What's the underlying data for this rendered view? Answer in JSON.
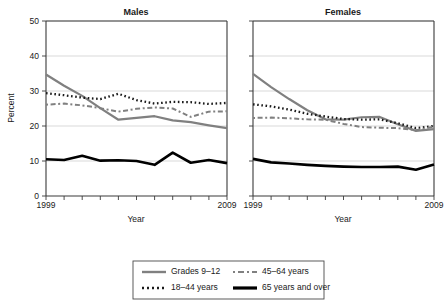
{
  "chart_data": {
    "type": "line",
    "title": "",
    "xlabel": "Year",
    "ylabel": "Percent",
    "ylim": [
      0,
      50
    ],
    "yticks": [
      0,
      10,
      20,
      30,
      40,
      50
    ],
    "ytick_labels": [
      "0",
      "10",
      "20",
      "30",
      "40",
      "50"
    ],
    "xlim": [
      1999,
      2009
    ],
    "x": [
      1999,
      2000,
      2001,
      2002,
      2003,
      2004,
      2005,
      2006,
      2007,
      2008,
      2009
    ],
    "xtick_labels_shown": [
      "1999",
      "2009"
    ],
    "grid": "horizontal",
    "legend_position": "bottom-center",
    "panels": [
      {
        "name": "males",
        "title": "Males",
        "xlabel": "Year",
        "series": [
          {
            "name": "Grades 9-12",
            "style": "solid-gray",
            "color": "#808080",
            "values": [
              34.7,
              31.5,
              28.6,
              25.1,
              21.8,
              22.3,
              22.8,
              21.6,
              21.1,
              20.2,
              19.4
            ]
          },
          {
            "name": "18-44 years",
            "style": "dotted-black",
            "color": "#1a1a1a",
            "values": [
              29.4,
              28.8,
              28.1,
              27.7,
              29.2,
              27.4,
              26.4,
              26.9,
              26.8,
              26.3,
              26.6
            ]
          },
          {
            "name": "45-64 years",
            "style": "dashed-gray",
            "color": "#808080",
            "values": [
              26.1,
              26.4,
              25.9,
              25.1,
              24.1,
              24.9,
              25.3,
              25.0,
              22.6,
              24.1,
              24.2
            ]
          },
          {
            "name": "65 years and over",
            "style": "solid-black-thick",
            "color": "#000000",
            "values": [
              10.5,
              10.3,
              11.5,
              10.1,
              10.2,
              10.0,
              8.9,
              12.4,
              9.5,
              10.3,
              9.4
            ]
          }
        ]
      },
      {
        "name": "females",
        "title": "Females",
        "xlabel": "Year",
        "series": [
          {
            "name": "Grades 9-12",
            "style": "solid-gray",
            "color": "#808080",
            "values": [
              34.9,
              31.1,
              27.7,
              24.5,
              21.9,
              21.8,
              22.5,
              22.6,
              20.5,
              18.6,
              19.1
            ]
          },
          {
            "name": "18-44 years",
            "style": "dotted-black",
            "color": "#1a1a1a",
            "values": [
              26.2,
              25.6,
              24.7,
              23.5,
              22.7,
              22.0,
              21.8,
              21.9,
              20.8,
              19.4,
              20.0
            ]
          },
          {
            "name": "45-64 years",
            "style": "dashed-gray",
            "color": "#808080",
            "values": [
              22.3,
              22.4,
              22.2,
              21.9,
              21.8,
              20.6,
              19.7,
              19.5,
              19.4,
              18.8,
              19.8
            ]
          },
          {
            "name": "65 years and over",
            "style": "solid-black-thick",
            "color": "#000000",
            "values": [
              10.6,
              9.6,
              9.3,
              8.9,
              8.6,
              8.4,
              8.3,
              8.3,
              8.4,
              7.5,
              9.0
            ]
          }
        ]
      }
    ],
    "legend": [
      {
        "label": "Grades 9–12",
        "style": "solid-gray",
        "color": "#808080"
      },
      {
        "label": "45–64 years",
        "style": "dashed-gray",
        "color": "#808080"
      },
      {
        "label": "18–44 years",
        "style": "dotted-black",
        "color": "#1a1a1a"
      },
      {
        "label": "65 years and over",
        "style": "solid-black-thick",
        "color": "#000000"
      }
    ]
  },
  "axes": {
    "y_label": "Percent",
    "y_ticks": [
      "50",
      "40",
      "30",
      "20",
      "10",
      "0"
    ],
    "x_label_left": "Year",
    "x_label_right": "Year",
    "x_start_left": "1999",
    "x_end_left": "2009",
    "x_start_right": "1999",
    "x_end_right": "2009"
  },
  "panel_titles": {
    "left": "Males",
    "right": "Females"
  },
  "legend_labels": {
    "item0": "Grades 9–12",
    "item1": "45–64 years",
    "item2": "18–44 years",
    "item3": "65 years and over"
  },
  "colors": {
    "gray_series": "#808080",
    "black_series": "#000000",
    "dotted_series": "#1a1a1a",
    "grid": "#c8c8c8",
    "axis": "#3a3a3a",
    "background": "#ffffff"
  }
}
